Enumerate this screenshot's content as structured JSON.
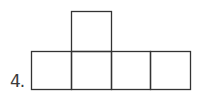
{
  "problem": {
    "number_label": "4."
  },
  "figure": {
    "stroke_color": "#333333",
    "squares": [
      {
        "id": "top",
        "x": 71,
        "y": 11,
        "w": 40,
        "h": 40
      },
      {
        "id": "row-1",
        "x": 31,
        "y": 51,
        "w": 40,
        "h": 38
      },
      {
        "id": "row-2",
        "x": 71,
        "y": 51,
        "w": 40,
        "h": 38
      },
      {
        "id": "row-3",
        "x": 111,
        "y": 51,
        "w": 39,
        "h": 38
      },
      {
        "id": "row-4",
        "x": 150,
        "y": 51,
        "w": 40,
        "h": 38
      }
    ]
  }
}
